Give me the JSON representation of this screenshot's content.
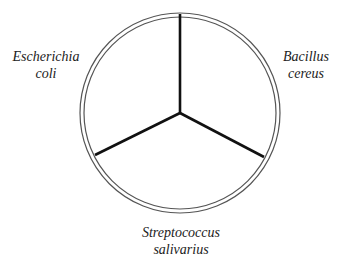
{
  "diagram": {
    "type": "petri-dish-sectors",
    "sectors": [
      {
        "label_line1": "Escherichia",
        "label_line2": "coli",
        "position": "left"
      },
      {
        "label_line1": "Bacillus",
        "label_line2": "cereus",
        "position": "right"
      },
      {
        "label_line1": "Streptococcus",
        "label_line2": "salivarius",
        "position": "bottom"
      }
    ],
    "colors": {
      "rim": "#555555",
      "divider": "#111111",
      "text": "#222222"
    }
  }
}
